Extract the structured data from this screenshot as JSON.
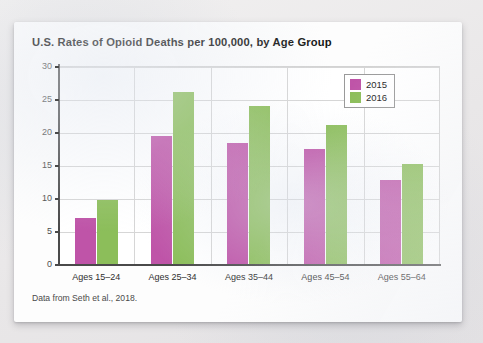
{
  "chart_data": {
    "type": "bar",
    "title": "U.S. Rates of Opioid Deaths per 100,000, by Age Group",
    "source_note": "Data from Seth et al., 2018.",
    "xlabel": "",
    "ylabel": "",
    "ylim": [
      0,
      30
    ],
    "ytick_step": 5,
    "yticks": [
      0,
      5,
      10,
      15,
      20,
      25,
      30
    ],
    "ytick_labels": [
      "0",
      "5",
      "10",
      "15",
      "20",
      "25",
      "30"
    ],
    "grid": "horizontal-and-vertical",
    "legend_position": "top-right",
    "categories": [
      "Ages 15–24",
      "Ages 25–34",
      "Ages 35–44",
      "Ages 45–54",
      "Ages 55–64"
    ],
    "series": [
      {
        "name": "2015",
        "color": "#bf54a8",
        "values": [
          7.0,
          19.4,
          18.3,
          17.5,
          12.8
        ]
      },
      {
        "name": "2016",
        "color": "#8cbe5a",
        "values": [
          9.7,
          26.0,
          24.0,
          21.1,
          15.2
        ]
      }
    ]
  },
  "colors": {
    "series_2015": "#bf54a8",
    "series_2016": "#8cbe5a",
    "axis": "#4a4a4a",
    "gridline": "#d6d6d6",
    "card_background": "#fdfdfd",
    "page_background": "#eceaea"
  }
}
